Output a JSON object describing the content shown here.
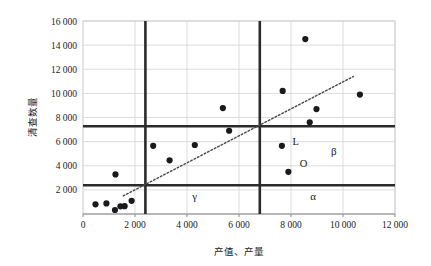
{
  "chart_data": {
    "type": "scatter",
    "title": "",
    "xlabel": "产值、产量",
    "ylabel": "清查数量",
    "xlim": [
      0,
      12000
    ],
    "ylim": [
      0,
      16000
    ],
    "grid": true,
    "legend": "none",
    "xticks": [
      0,
      2000,
      4000,
      6000,
      8000,
      10000,
      12000
    ],
    "xtick_labels": [
      "0",
      "2 000",
      "4 000",
      "6 000",
      "8 000",
      "10 000",
      "12 000"
    ],
    "yticks": [
      2000,
      4000,
      6000,
      8000,
      10000,
      12000,
      14000,
      16000
    ],
    "ytick_labels": [
      "2 000",
      "4 000",
      "6 000",
      "8 000",
      "10 000",
      "12 000",
      "14 000",
      "16 000"
    ],
    "series": [
      {
        "name": "样本点",
        "marker": "circle",
        "color": "#1a1a1a",
        "points": [
          {
            "x": 480,
            "y": 800
          },
          {
            "x": 900,
            "y": 880
          },
          {
            "x": 1230,
            "y": 330
          },
          {
            "x": 1250,
            "y": 3280
          },
          {
            "x": 1440,
            "y": 640
          },
          {
            "x": 1600,
            "y": 650
          },
          {
            "x": 1870,
            "y": 1090
          },
          {
            "x": 2700,
            "y": 5650
          },
          {
            "x": 3330,
            "y": 4450
          },
          {
            "x": 4300,
            "y": 5720
          },
          {
            "x": 5380,
            "y": 8780
          },
          {
            "x": 5620,
            "y": 6900
          },
          {
            "x": 7650,
            "y": 5650
          },
          {
            "x": 7680,
            "y": 10200
          },
          {
            "x": 7900,
            "y": 3500
          },
          {
            "x": 8550,
            "y": 14500
          },
          {
            "x": 8720,
            "y": 7600
          },
          {
            "x": 8980,
            "y": 8700
          },
          {
            "x": 10650,
            "y": 9900
          }
        ]
      }
    ],
    "trend_line": {
      "name": "趋势线",
      "style": "dotted",
      "color": "#4a4a4a",
      "x_start": 1550,
      "y_start": 1500,
      "x_end": 10400,
      "y_end": 11400
    },
    "threshold_lines": {
      "color": "#2b2b2b",
      "vertical": [
        {
          "name": "v-threshold-low",
          "x": 2400
        },
        {
          "name": "v-threshold-high",
          "x": 6800
        }
      ],
      "horizontal": [
        {
          "name": "h-threshold-low",
          "y": 2380
        },
        {
          "name": "h-threshold-high",
          "y": 7270
        }
      ]
    },
    "annotations": [
      {
        "name": "region-gamma",
        "text": "γ",
        "x": 4300,
        "y": 1150
      },
      {
        "name": "region-alpha",
        "text": "α",
        "x": 8850,
        "y": 1150
      },
      {
        "name": "region-beta",
        "text": "β",
        "x": 9650,
        "y": 4900
      },
      {
        "name": "point-label-L",
        "text": "L",
        "x": 8180,
        "y": 5700
      },
      {
        "name": "point-label-O",
        "text": "O",
        "x": 8480,
        "y": 3900
      }
    ]
  }
}
